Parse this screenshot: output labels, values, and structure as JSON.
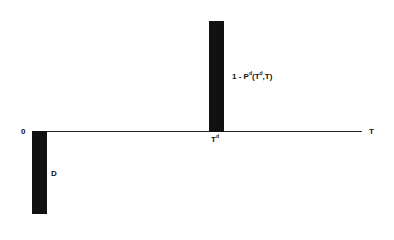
{
  "diagram": {
    "type": "cash-flow timeline",
    "axis": {
      "origin_label": "0",
      "end_label": "T"
    },
    "flows": [
      {
        "name": "outflow-D",
        "direction": "down",
        "time_label": "0",
        "amount_label": "D"
      },
      {
        "name": "inflow-at-Td",
        "direction": "up",
        "time_label_base": "T",
        "time_label_sup": "d",
        "amount_label_parts": {
          "prefix": "1 - P",
          "sup1": "d",
          "mid1": "(T",
          "sup2": "d",
          "mid2": ",T)"
        }
      }
    ],
    "colors": {
      "bar": "#111111",
      "axis": "#222222",
      "background": "#ffffff"
    }
  }
}
